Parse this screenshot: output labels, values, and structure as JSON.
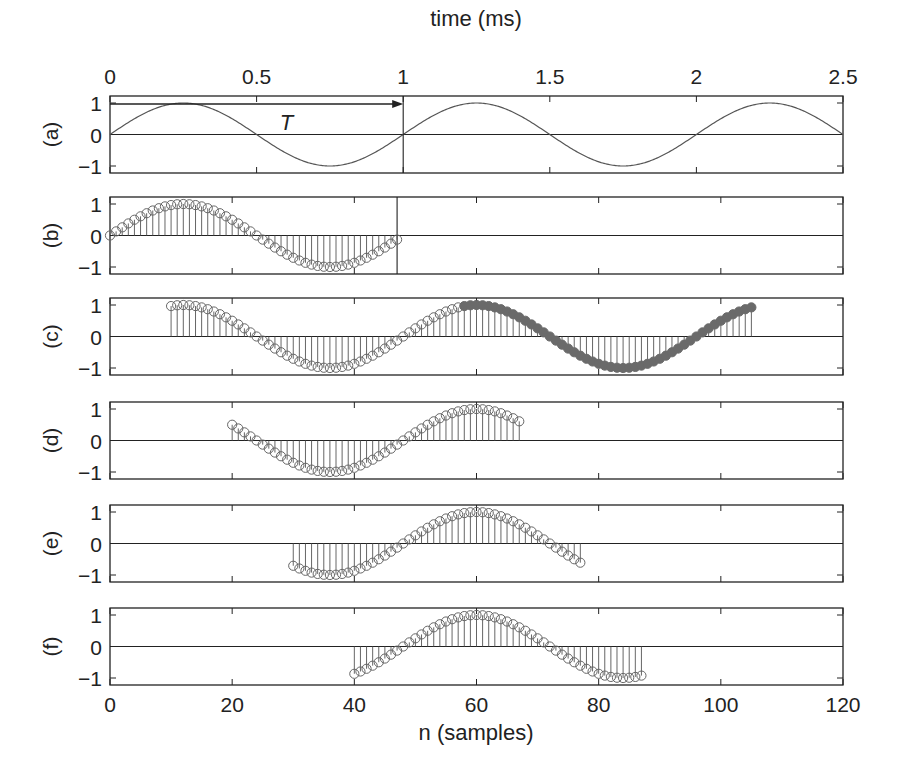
{
  "figure": {
    "top_axis_label": "time (ms)",
    "bottom_axis_label": "n (samples)",
    "period_label": "T",
    "colors": {
      "ink": "#222222",
      "line": "#555555",
      "marker": "#666666",
      "filled_marker": "#6a6a6a"
    }
  },
  "chart_data": {
    "type": "stem",
    "title": "",
    "xlabel": "n (samples)",
    "x2label": "time (ms)",
    "xlim": [
      0,
      120
    ],
    "x2lim": [
      0,
      2.5
    ],
    "xticks": [
      0,
      20,
      40,
      60,
      80,
      100,
      120
    ],
    "x2ticks": [
      0,
      0.5,
      1,
      1.5,
      2,
      2.5
    ],
    "x2tick_labels": [
      "0",
      "0.5",
      "1",
      "1.5",
      "2",
      "2.5"
    ],
    "yticks": [
      -1,
      0,
      1
    ],
    "ytick_labels": [
      "−1",
      "0",
      "1"
    ],
    "ylim": [
      -1.2,
      1.2
    ],
    "samples_per_period": 48,
    "period_ms": 1,
    "grid": false,
    "panels": [
      {
        "label": "(a)",
        "kind": "line",
        "function": "sin(2*pi*t/T)",
        "t_range_ms": [
          0,
          2.5
        ],
        "marker_line_ms": 1,
        "annotation": "T"
      },
      {
        "label": "(b)",
        "kind": "stem",
        "n_start": 0,
        "n_end": 47,
        "function": "sin(2*pi*n/48)",
        "marker_line_n": 47
      },
      {
        "label": "(c)",
        "kind": "stem",
        "n_start": 10,
        "n_end": 105,
        "function": "sin(2*pi*n/48)",
        "filled_from_n": 58
      },
      {
        "label": "(d)",
        "kind": "stem",
        "n_start": 20,
        "n_end": 67,
        "function": "sin(2*pi*n/48)"
      },
      {
        "label": "(e)",
        "kind": "stem",
        "n_start": 30,
        "n_end": 77,
        "function": "sin(2*pi*n/48)"
      },
      {
        "label": "(f)",
        "kind": "stem",
        "n_start": 40,
        "n_end": 87,
        "function": "sin(2*pi*n/48)"
      }
    ]
  }
}
